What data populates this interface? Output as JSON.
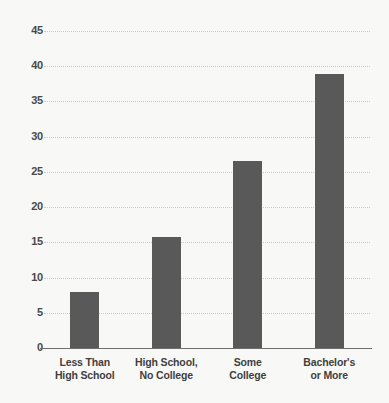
{
  "chart_data": {
    "type": "bar",
    "title": "",
    "xlabel": "",
    "ylabel": "",
    "ylim": [
      0,
      45
    ],
    "yticks": [
      0,
      5,
      10,
      15,
      20,
      25,
      30,
      35,
      40,
      45
    ],
    "ytick_labels": [
      "0",
      "5",
      "10",
      "15",
      "20",
      "25",
      "30",
      "35",
      "40",
      "45"
    ],
    "grid": true,
    "grid_style": "dotted-horizontal",
    "legend": "none",
    "bar_color": "#595959",
    "background_color": "#f8f8f6",
    "axis_color": "#6e6e6e",
    "gridline_color": "#c9c9c4",
    "categories": [
      "Less Than High School",
      "High School, No College",
      "Some College",
      "Bachelor's or More"
    ],
    "category_lines": [
      [
        "Less Than",
        "High School"
      ],
      [
        "High School,",
        "No College"
      ],
      [
        "Some",
        "College"
      ],
      [
        "Bachelor's",
        "or More"
      ]
    ],
    "values": [
      8.0,
      15.7,
      26.5,
      38.9
    ]
  }
}
